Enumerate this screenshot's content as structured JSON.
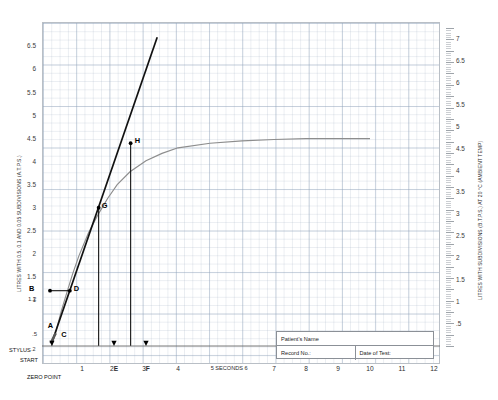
{
  "chart_data": {
    "type": "line",
    "xlabel": "SECONDS",
    "ylabel_left": "LITRES WITH 0.5, 0.1 AND 0.05 SUBDIVISIONS (A.T.P.S.)",
    "ylabel_right": "LITRES WITH SUBDIVISIONS (B.T.P.S.) AT 20 °C (AMBIENT TEMP)",
    "xlim": [
      0,
      12
    ],
    "ylim_left": [
      0,
      6.9
    ],
    "ylim_right": [
      0,
      7.25
    ],
    "grid": true,
    "legend": "none",
    "x_ticks": [
      "1",
      "2",
      "3",
      "4",
      "5",
      "6",
      "7",
      "8",
      "9",
      "10",
      "11",
      "12"
    ],
    "x_tick_extra": [
      "2E",
      "3F",
      "5 SECONDS 6"
    ],
    "y_ticks_left": [
      "6.5",
      "6",
      "5.5",
      "5",
      "4.5",
      "4",
      "3.5",
      "3",
      "2.5",
      "2",
      "1.5",
      "1.2",
      "1",
      ".5",
      ".2"
    ],
    "y_ticks_right": [
      "7",
      "6.5",
      "6",
      "5.5",
      "5",
      "4.5",
      "4",
      "3.5",
      "3",
      "2.5",
      "2",
      "1.5",
      "1",
      ".5"
    ],
    "series": [
      {
        "name": "spirogram-curve",
        "color": "#8d8d8d",
        "comment": "Expiratory volume-time curve rising to plateau at 4.5 L",
        "points": [
          [
            0.05,
            0.0
          ],
          [
            0.2,
            0.35
          ],
          [
            0.35,
            0.75
          ],
          [
            0.5,
            1.1
          ],
          [
            0.7,
            1.55
          ],
          [
            0.9,
            1.95
          ],
          [
            1.2,
            2.45
          ],
          [
            1.5,
            2.85
          ],
          [
            1.8,
            3.2
          ],
          [
            2.1,
            3.5
          ],
          [
            2.5,
            3.78
          ],
          [
            3.0,
            4.02
          ],
          [
            3.5,
            4.18
          ],
          [
            4.0,
            4.3
          ],
          [
            5.0,
            4.4
          ],
          [
            6.0,
            4.45
          ],
          [
            7.0,
            4.48
          ],
          [
            8.0,
            4.5
          ],
          [
            9.0,
            4.5
          ],
          [
            10.0,
            4.5
          ]
        ]
      },
      {
        "name": "tangent-line",
        "color": "#111111",
        "comment": "Straight slope line through C, D, G, H to 6.7 L",
        "points": [
          [
            0.08,
            0.12
          ],
          [
            3.35,
            6.7
          ]
        ]
      },
      {
        "name": "stylus-line",
        "color": "#555555",
        "comment": "Short stylus start stroke A to C",
        "points": [
          [
            0.02,
            0.06
          ],
          [
            0.18,
            0.28
          ]
        ]
      }
    ],
    "annotations": [
      {
        "label": "A",
        "x": 0.02,
        "y": 0.28,
        "name": "point-a"
      },
      {
        "label": "B",
        "x": -0.35,
        "y": 1.2,
        "name": "point-b"
      },
      {
        "label": "C",
        "x": 0.26,
        "y": 0.2,
        "name": "point-c"
      },
      {
        "label": "D",
        "x": 0.62,
        "y": 1.2,
        "name": "point-d"
      },
      {
        "label": "E",
        "x": 2.0,
        "y": 0.0,
        "name": "point-e"
      },
      {
        "label": "F",
        "x": 3.0,
        "y": 0.0,
        "name": "point-f"
      },
      {
        "label": "G",
        "x": 1.52,
        "y": 3.0,
        "name": "point-g"
      },
      {
        "label": "H",
        "x": 2.52,
        "y": 4.4,
        "name": "point-h"
      }
    ],
    "value_labels": {
      "b_value": "1.2",
      "half": ".5",
      "two_tenths": ".2"
    },
    "markers": {
      "stylus": "STYLUS",
      "start": "START",
      "zero_point": "ZERO POINT"
    }
  },
  "patient_form": {
    "name_label": "Patient's Name",
    "record_label": "Record No.:",
    "date_label": "Date of Test:"
  }
}
